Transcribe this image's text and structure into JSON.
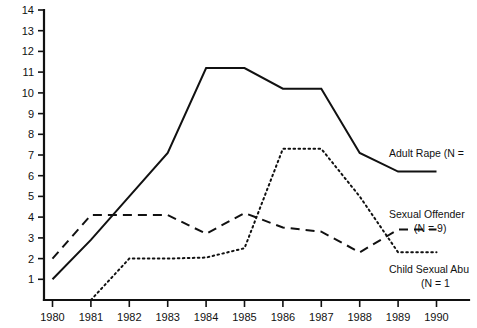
{
  "chart_data": {
    "type": "line",
    "title": "",
    "subtitle": "",
    "xlabel": "",
    "ylabel": "",
    "x": [
      1980,
      1981,
      1982,
      1983,
      1984,
      1985,
      1986,
      1987,
      1988,
      1989,
      1990
    ],
    "categories": [
      "1980",
      "1981",
      "1982",
      "1983",
      "1984",
      "1985",
      "1986",
      "1987",
      "1988",
      "1989",
      "1990"
    ],
    "xlim": [
      1980,
      1990
    ],
    "ylim": [
      0,
      14
    ],
    "yticks": [
      1,
      2,
      3,
      4,
      5,
      6,
      7,
      8,
      9,
      10,
      11,
      12,
      13,
      14
    ],
    "ytick_labels": [
      "1",
      "2",
      "3",
      "4",
      "5",
      "6",
      "7",
      "8",
      "9",
      "10",
      "11",
      "12",
      "13",
      "14"
    ],
    "grid": false,
    "legend_position": "right-inline",
    "series": [
      {
        "name": "Adult Rape",
        "style": "solid",
        "values": [
          1.0,
          2.9,
          5.0,
          7.1,
          11.2,
          11.2,
          10.2,
          10.2,
          7.1,
          6.2,
          6.2
        ]
      },
      {
        "name": "Sexual Offender",
        "style": "dashed",
        "values": [
          2.0,
          4.1,
          4.1,
          4.1,
          3.2,
          4.2,
          3.5,
          3.3,
          2.3,
          3.4,
          3.4
        ]
      },
      {
        "name": "Child Sexual Abuse",
        "style": "dotted",
        "values": [
          null,
          0.0,
          2.0,
          2.0,
          2.05,
          2.5,
          7.3,
          7.3,
          5.0,
          2.3,
          2.3
        ]
      }
    ]
  },
  "axes": {
    "y_ticks": [
      "14",
      "13",
      "12",
      "11",
      "10",
      "9",
      "8",
      "7",
      "6",
      "5",
      "4",
      "3",
      "2",
      "1"
    ],
    "x_ticks": [
      "1980",
      "1981",
      "1982",
      "1983",
      "1984",
      "1985",
      "1986",
      "1987",
      "1988",
      "1989",
      "1990"
    ]
  },
  "legend": {
    "items": [
      {
        "id": "adult-rape",
        "line1": "Adult Rape (N =",
        "line2": "",
        "style": "solid",
        "truncated": true
      },
      {
        "id": "sexual-offender",
        "line1": "Sexual Offender",
        "line2": "(N = 9)",
        "style": "dashed",
        "truncated": false
      },
      {
        "id": "child-sexual-abuse",
        "line1": "Child Sexual Abu",
        "line2": "(N = 1",
        "style": "dotted",
        "truncated": true
      }
    ]
  },
  "colors": {
    "ink": "#111111",
    "background": "#ffffff"
  }
}
